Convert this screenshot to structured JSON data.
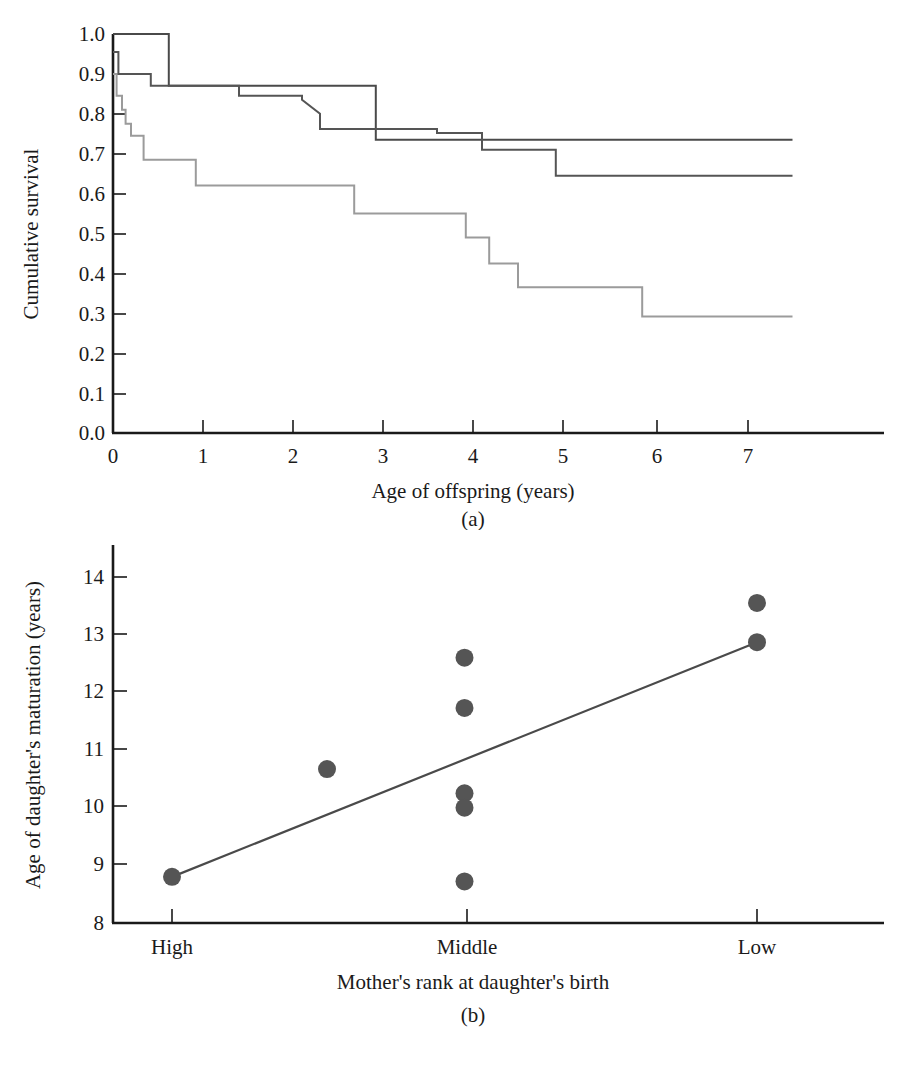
{
  "figure": {
    "panels": [
      {
        "id": "a",
        "caption": "(a)"
      },
      {
        "id": "b",
        "caption": "(b)"
      }
    ]
  },
  "chart_data": [
    {
      "type": "line",
      "id": "panel-a",
      "subtype": "kaplan-meier-step",
      "title": "",
      "caption": "(a)",
      "xlabel": "Age of offspring (years)",
      "ylabel": "Cumulative survival",
      "xlim": [
        0,
        7.9
      ],
      "ylim": [
        0.0,
        1.0
      ],
      "xticks": [
        0,
        1,
        2,
        3,
        4,
        5,
        6,
        7
      ],
      "xticklabels": [
        "0",
        "1",
        "2",
        "3",
        "4",
        "5",
        "6",
        "7"
      ],
      "yticks": [
        0.0,
        0.1,
        0.2,
        0.3,
        0.4,
        0.5,
        0.6,
        0.7,
        0.8,
        0.9,
        1.0
      ],
      "yticklabels": [
        "0.0",
        "0.1",
        "0.2",
        "0.3",
        "0.4",
        "0.5",
        "0.6",
        "0.7",
        "0.8",
        "0.9",
        "1.0"
      ],
      "grid": false,
      "legend": "none",
      "series": [
        {
          "name": "high-rank",
          "color": "#4a4a4a",
          "linewidth": 2.0,
          "steps": [
            [
              0.0,
              1.0
            ],
            [
              0.62,
              1.0
            ],
            [
              0.62,
              0.87
            ],
            [
              2.92,
              0.87
            ],
            [
              2.92,
              0.735
            ],
            [
              7.55,
              0.735
            ]
          ]
        },
        {
          "name": "middle-rank",
          "color": "#555555",
          "linewidth": 2.0,
          "steps": [
            [
              0.0,
              0.955
            ],
            [
              0.06,
              0.955
            ],
            [
              0.06,
              0.9
            ],
            [
              0.42,
              0.9
            ],
            [
              0.42,
              0.87
            ],
            [
              1.4,
              0.87
            ],
            [
              1.4,
              0.845
            ],
            [
              2.1,
              0.845
            ],
            [
              2.1,
              0.835
            ],
            [
              2.3,
              0.8
            ],
            [
              2.3,
              0.762
            ],
            [
              3.6,
              0.762
            ],
            [
              3.6,
              0.752
            ],
            [
              4.1,
              0.752
            ],
            [
              4.1,
              0.71
            ],
            [
              4.92,
              0.71
            ],
            [
              4.92,
              0.645
            ],
            [
              7.55,
              0.645
            ]
          ]
        },
        {
          "name": "low-rank",
          "color": "#9b9b9b",
          "linewidth": 2.0,
          "steps": [
            [
              0.0,
              0.9
            ],
            [
              0.04,
              0.9
            ],
            [
              0.04,
              0.845
            ],
            [
              0.1,
              0.845
            ],
            [
              0.1,
              0.81
            ],
            [
              0.14,
              0.81
            ],
            [
              0.14,
              0.775
            ],
            [
              0.2,
              0.775
            ],
            [
              0.2,
              0.745
            ],
            [
              0.34,
              0.745
            ],
            [
              0.34,
              0.685
            ],
            [
              0.92,
              0.685
            ],
            [
              0.92,
              0.62
            ],
            [
              2.68,
              0.62
            ],
            [
              2.68,
              0.55
            ],
            [
              3.92,
              0.55
            ],
            [
              3.92,
              0.49
            ],
            [
              4.18,
              0.49
            ],
            [
              4.18,
              0.425
            ],
            [
              4.5,
              0.425
            ],
            [
              4.5,
              0.365
            ],
            [
              5.88,
              0.365
            ],
            [
              5.88,
              0.292
            ],
            [
              7.55,
              0.292
            ]
          ]
        }
      ]
    },
    {
      "type": "scatter",
      "id": "panel-b",
      "title": "",
      "caption": "(b)",
      "xlabel": "Mother's rank at daughter's birth",
      "ylabel": "Age of daughter's maturation (years)",
      "categories": [
        "High",
        "Middle",
        "Low"
      ],
      "xticks": [
        1,
        2,
        3
      ],
      "xticklabels": [
        "High",
        "Middle",
        "Low"
      ],
      "xlim": [
        0.6,
        3.55
      ],
      "ylim": [
        8,
        14.4
      ],
      "yticks": [
        8,
        9,
        10,
        11,
        12,
        13,
        14
      ],
      "yticklabels": [
        "8",
        "9",
        "10",
        "11",
        "12",
        "13",
        "14"
      ],
      "grid": false,
      "legend": "none",
      "marker_color": "#555555",
      "marker_size": 9,
      "points": [
        {
          "x": 1.0,
          "category": "High",
          "y": 8.8
        },
        {
          "x": 1.53,
          "category": "High-Middle",
          "y": 10.67
        },
        {
          "x": 2.0,
          "category": "Middle",
          "y": 12.6
        },
        {
          "x": 2.0,
          "category": "Middle",
          "y": 11.73
        },
        {
          "x": 2.0,
          "category": "Middle",
          "y": 10.25
        },
        {
          "x": 2.0,
          "category": "Middle",
          "y": 10.0
        },
        {
          "x": 2.0,
          "category": "Middle",
          "y": 8.72
        },
        {
          "x": 3.0,
          "category": "Low",
          "y": 13.55
        },
        {
          "x": 3.0,
          "category": "Low",
          "y": 12.87
        }
      ],
      "fit_line": {
        "name": "regression-line",
        "color": "#4a4a4a",
        "linewidth": 2.2,
        "x0": 1.0,
        "y0": 8.8,
        "x1": 3.0,
        "y1": 12.87
      }
    }
  ]
}
